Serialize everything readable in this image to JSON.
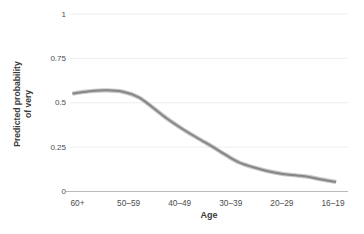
{
  "colors": {
    "background": "#ffffff",
    "gridline": "#ededed",
    "axis_line": "#b9b9b9",
    "curve_core": "#868686",
    "curve_band": "#c6c6c6",
    "tick_text": "#4d4d4d",
    "title_text": "#3b3b3b"
  },
  "chart_data": {
    "type": "line",
    "title": "",
    "xlabel": "Age",
    "ylabel": "Predicted probability of very",
    "ylabel_line1": "Predicted probability",
    "ylabel_line2": "of very",
    "categories": [
      "60+",
      "50–59",
      "40–49",
      "30–39",
      "20–29",
      "16–19"
    ],
    "values": [
      0.56,
      0.55,
      0.36,
      0.18,
      0.1,
      0.06
    ],
    "ylim": [
      0,
      1
    ],
    "yticks": {
      "labels": [
        "1",
        "0.75",
        "0.5",
        "0.25",
        "0"
      ],
      "values": [
        1,
        0.75,
        0.5,
        0.25,
        0
      ]
    },
    "grid": "horizontal gridlines at y ticks",
    "legend": "none",
    "band": "narrow confidence band hugging the line",
    "curve_samples": {
      "x": [
        -0.1,
        0.21,
        0.55,
        0.87,
        1.19,
        1.46,
        1.75,
        2.04,
        2.33,
        2.63,
        2.9,
        3.17,
        3.46,
        3.75,
        4.01,
        4.3,
        4.53,
        4.77,
        5.0,
        5.06
      ],
      "y": [
        0.552,
        0.564,
        0.57,
        0.563,
        0.532,
        0.476,
        0.411,
        0.355,
        0.304,
        0.254,
        0.206,
        0.163,
        0.135,
        0.113,
        0.099,
        0.09,
        0.082,
        0.068,
        0.057,
        0.054
      ]
    }
  }
}
